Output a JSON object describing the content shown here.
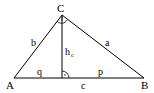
{
  "diagram": {
    "vertices": {
      "A": "A",
      "B": "B",
      "C": "C"
    },
    "sides": {
      "a": "a",
      "b": "b",
      "c": "c"
    },
    "altitude": {
      "label": "h",
      "subscript": "c"
    },
    "segments": {
      "q": "q",
      "p": "p"
    },
    "colors": {
      "stroke": "#000000",
      "background": "#ffffff"
    }
  }
}
